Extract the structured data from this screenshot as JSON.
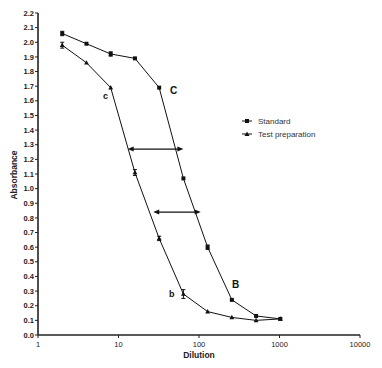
{
  "chart_data": {
    "type": "line",
    "title": "",
    "xlabel": "Dilution",
    "ylabel": "Absorbance",
    "xscale": "log",
    "xlim": [
      1,
      10000
    ],
    "ylim": [
      0.0,
      2.2
    ],
    "x_ticks": [
      "1",
      "10",
      "100",
      "1000",
      "10000"
    ],
    "y_ticks": [
      "0.0",
      "0.1",
      "0.2",
      "0.3",
      "0.4",
      "0.5",
      "0.6",
      "0.7",
      "0.8",
      "0.9",
      "1.0",
      "1.1",
      "1.2",
      "1.3",
      "1.4",
      "1.5",
      "1.6",
      "1.7",
      "1.8",
      "1.9",
      "2.0",
      "2.1",
      "2.2"
    ],
    "grid": false,
    "legend_position": "right-middle",
    "x": [
      2,
      4,
      8,
      16,
      32,
      64,
      128,
      256,
      512,
      1024
    ],
    "series": [
      {
        "name": "Standard",
        "marker": "square",
        "values": [
          2.06,
          1.99,
          1.92,
          1.89,
          1.69,
          1.07,
          0.6,
          0.24,
          0.13,
          0.11
        ]
      },
      {
        "name": "Test preparation",
        "marker": "triangle",
        "values": [
          1.98,
          1.86,
          1.69,
          1.11,
          0.66,
          0.28,
          0.16,
          0.12,
          0.1,
          0.11
        ]
      }
    ],
    "annotations": [
      {
        "text": "C",
        "near": "Standard at dilution 32"
      },
      {
        "text": "B",
        "near": "Standard at dilution 256"
      },
      {
        "text": "c",
        "near": "Test preparation at dilution 8"
      },
      {
        "text": "b",
        "near": "Test preparation at dilution 64"
      },
      {
        "text": "double-arrow",
        "y": 1.27,
        "from_x": 13,
        "to_x": 64
      },
      {
        "text": "double-arrow",
        "y": 0.84,
        "from_x": 27,
        "to_x": 105
      }
    ]
  },
  "labels": {
    "xlabel": "Dilution",
    "ylabel": "Absorbance",
    "legend_standard": "Standard",
    "legend_test": "Test preparation",
    "ann_C": "C",
    "ann_B": "B",
    "ann_c": "c",
    "ann_b": "b"
  }
}
